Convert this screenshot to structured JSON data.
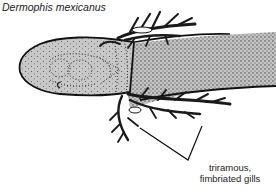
{
  "figure": {
    "title": "Dermophis mexicanus",
    "annotation_line1": "triramous,",
    "annotation_line2": "fimbriated gills",
    "colors": {
      "body_fill": "#c8c8c8",
      "outline": "#111111",
      "background": "#ffffff"
    }
  }
}
